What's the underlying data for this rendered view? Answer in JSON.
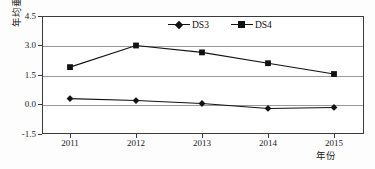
{
  "chart_data": {
    "type": "line",
    "title": "",
    "xlabel": "年份",
    "ylabel": "年均垂直位移/mm",
    "categories": [
      "2011",
      "2012",
      "2013",
      "2014",
      "2015"
    ],
    "x": [
      2011,
      2012,
      2013,
      2014,
      2015
    ],
    "series": [
      {
        "name": "DS3",
        "marker": "diamond",
        "color": "#111111",
        "values": [
          0.3,
          0.2,
          0.05,
          -0.2,
          -0.15
        ]
      },
      {
        "name": "DS4",
        "marker": "square",
        "color": "#111111",
        "values": [
          1.9,
          3.0,
          2.65,
          2.1,
          1.55
        ]
      }
    ],
    "ylim": [
      -1.5,
      4.5
    ],
    "yticks": [
      4.5,
      3.0,
      1.5,
      0.0,
      -1.5
    ],
    "ytick_labels": [
      "4.5",
      "3.0",
      "1.5",
      "0.0",
      "-1.5"
    ],
    "grid": true,
    "grid_axis": "y",
    "legend_position": "top-center",
    "axis_color": "#3b3b3b",
    "grid_color": "#9a9a9a",
    "background": "#ffffff"
  },
  "legend": {
    "entries": [
      {
        "label": "DS3"
      },
      {
        "label": "DS4"
      }
    ]
  },
  "axes": {
    "y_title": "年均垂直位移/mm",
    "x_title": "年份"
  }
}
